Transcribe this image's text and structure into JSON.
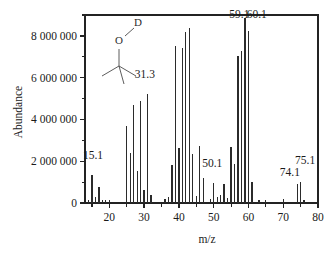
{
  "chart_data": {
    "type": "bar",
    "title": "",
    "xlabel": "m/z",
    "ylabel": "Abundance",
    "xlim": [
      13,
      80
    ],
    "ylim": [
      0,
      9000000
    ],
    "grid": false,
    "legend": null,
    "x_ticks": [
      "20",
      "30",
      "40",
      "50",
      "60",
      "70",
      "80"
    ],
    "x_tick_values": [
      20,
      30,
      40,
      50,
      60,
      70,
      80
    ],
    "y_ticks": [
      "0",
      "2 000 000",
      "4 000 000",
      "6 000 000",
      "8 000 000"
    ],
    "y_tick_values": [
      0,
      2000000,
      4000000,
      6000000,
      8000000
    ],
    "x": [
      14,
      15,
      16,
      17,
      18,
      19,
      20,
      25,
      26,
      27,
      28,
      29,
      30,
      31,
      32,
      36,
      37,
      38,
      39,
      40,
      41,
      42,
      43,
      44,
      45,
      46,
      47,
      49,
      50,
      51,
      52,
      53,
      54,
      55,
      56,
      57,
      58,
      59,
      60,
      61,
      63,
      65,
      70,
      74,
      75,
      76
    ],
    "values": [
      130000,
      1330000,
      300000,
      760000,
      150000,
      130000,
      130000,
      3700000,
      2380000,
      4680000,
      1520000,
      4870000,
      640000,
      5240000,
      400000,
      170000,
      300000,
      1840000,
      7500000,
      2650000,
      7430000,
      8170000,
      8380000,
      2330000,
      330000,
      2720000,
      1180000,
      170000,
      950000,
      270000,
      400000,
      890000,
      230000,
      2680000,
      1870000,
      7050000,
      7280000,
      8870000,
      8240000,
      1010000,
      140000,
      130000,
      170000,
      900000,
      1020000,
      130000
    ],
    "annotations": [
      {
        "label": "15.1",
        "x": 15,
        "text_x": 15.3,
        "y": 2120000
      },
      {
        "label": "31.3",
        "x": 31,
        "text_x": 30.2,
        "y": 6000000
      },
      {
        "label": "50.1",
        "x": 50,
        "text_x": 49.6,
        "y": 1700000
      },
      {
        "label": "59.1",
        "x": 59,
        "text_x": 57.4,
        "y": 8850000
      },
      {
        "label": "60.1",
        "x": 60,
        "text_x": 62.4,
        "y": 8850000
      },
      {
        "label": "74.1",
        "x": 74,
        "text_x": 71.9,
        "y": 1280000
      },
      {
        "label": "75.1",
        "x": 75,
        "text_x": 76.3,
        "y": 1860000
      }
    ],
    "inset_structure": {
      "name": "tert-butanol-OD",
      "atom_labels": [
        "O",
        "D"
      ]
    }
  }
}
